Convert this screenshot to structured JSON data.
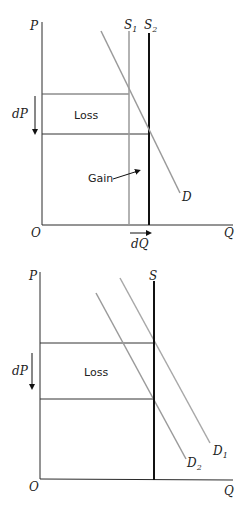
{
  "colors": {
    "axis": "#2a2a2a",
    "gray_line": "#9a9a9a",
    "black_line": "#111111",
    "text": "#222222"
  },
  "diagrams": [
    {
      "id": "top",
      "axes": {
        "y_label": "P",
        "x_label": "Q",
        "origin_label": "O"
      },
      "supply_curves": [
        {
          "label": "S",
          "subscript": "1",
          "style": "gray"
        },
        {
          "label": "S",
          "subscript": "2",
          "style": "black"
        }
      ],
      "demand_curves": [
        {
          "label": "D",
          "subscript": "",
          "style": "gray"
        }
      ],
      "annotations": {
        "price_change": "dP",
        "quantity_change": "dQ",
        "loss_area": "Loss",
        "gain_area": "Gain"
      }
    },
    {
      "id": "bottom",
      "axes": {
        "y_label": "P",
        "x_label": "Q",
        "origin_label": "O"
      },
      "supply_curves": [
        {
          "label": "S",
          "subscript": "",
          "style": "black"
        }
      ],
      "demand_curves": [
        {
          "label": "D",
          "subscript": "1",
          "style": "gray"
        },
        {
          "label": "D",
          "subscript": "2",
          "style": "gray"
        }
      ],
      "annotations": {
        "price_change": "dP",
        "loss_area": "Loss"
      }
    }
  ]
}
